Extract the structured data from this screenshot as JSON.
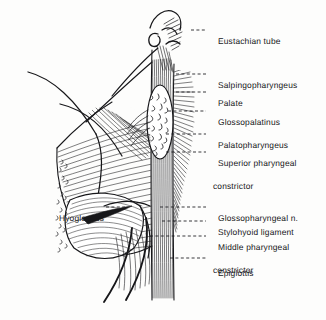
{
  "figure": {
    "kind": "anatomical-illustration",
    "background_color": "#fdfdfc",
    "ink_color": "#17171a",
    "width": 326,
    "height": 320
  },
  "labels": {
    "right": [
      {
        "id": "eustachian-tube",
        "text": "Eustachian tube",
        "continuation": "",
        "text_x": 208,
        "text_y": 26,
        "leader_from_x": 191,
        "leader_from_y": 30,
        "leader_to_x": 206,
        "leader_to_y": 30
      },
      {
        "id": "salpingopharyngeus",
        "text": "Salpingopharyngeus",
        "continuation": "",
        "text_x": 208,
        "text_y": 70,
        "leader_from_x": 176,
        "leader_from_y": 74,
        "leader_to_x": 206,
        "leader_to_y": 74
      },
      {
        "id": "palate",
        "text": "Palate",
        "continuation": "",
        "text_x": 208,
        "text_y": 88,
        "leader_from_x": 176,
        "leader_from_y": 92,
        "leader_to_x": 206,
        "leader_to_y": 92
      },
      {
        "id": "glossopalatinus",
        "text": "Glossopalatinus",
        "continuation": "",
        "text_x": 208,
        "text_y": 107,
        "leader_from_x": 168,
        "leader_from_y": 111,
        "leader_to_x": 206,
        "leader_to_y": 111
      },
      {
        "id": "palatopharyngeus",
        "text": "Palatopharyngeus",
        "continuation": "",
        "text_x": 208,
        "text_y": 130,
        "leader_from_x": 166,
        "leader_from_y": 134,
        "leader_to_x": 206,
        "leader_to_y": 134
      },
      {
        "id": "superior-pharyngeal-constrictor",
        "text": "Superior pharyngeal",
        "continuation": "constrictor",
        "text_x": 208,
        "text_y": 148,
        "leader_from_x": 166,
        "leader_from_y": 152,
        "leader_to_x": 206,
        "leader_to_y": 152
      },
      {
        "id": "glossopharyngeal-n",
        "text": "Glossopharyngeal n.",
        "continuation": "",
        "text_x": 208,
        "text_y": 203,
        "leader_from_x": 160,
        "leader_from_y": 207,
        "leader_to_x": 206,
        "leader_to_y": 207
      },
      {
        "id": "stylohyoid-ligament",
        "text": "Stylohyoid ligament",
        "continuation": "",
        "text_x": 208,
        "text_y": 217,
        "leader_from_x": 162,
        "leader_from_y": 221,
        "leader_to_x": 206,
        "leader_to_y": 221
      },
      {
        "id": "middle-pharyngeal-constrictor",
        "text": "Middle pharyngeal",
        "continuation": "constrictor",
        "text_x": 208,
        "text_y": 232,
        "leader_from_x": 150,
        "leader_from_y": 236,
        "leader_to_x": 206,
        "leader_to_y": 236
      },
      {
        "id": "epiglottis",
        "text": "Epiglottis",
        "continuation": "",
        "text_x": 208,
        "text_y": 258,
        "leader_from_x": 170,
        "leader_from_y": 258,
        "leader_to_x": 206,
        "leader_to_y": 258
      }
    ],
    "left": [
      {
        "id": "hyoglossus",
        "text": "Hyoglossus",
        "text_right_x": 104,
        "text_y": 203,
        "leader_from_x": 106,
        "leader_from_y": 207,
        "leader_to_x": 127,
        "leader_to_y": 207
      }
    ]
  },
  "structures": [
    {
      "id": "eustachian-tube-hook",
      "name": "Eustachian tube cartilage hook"
    },
    {
      "id": "palate-oval",
      "name": "Palate (stippled oval)"
    },
    {
      "id": "superior-constrictor-fan",
      "name": "Superior pharyngeal constrictor fan"
    },
    {
      "id": "vertical-muscle-band",
      "name": "Palatopharyngeus vertical band"
    },
    {
      "id": "hyoglossus-body",
      "name": "Hyoglossus muscle body"
    },
    {
      "id": "epiglottis-curves",
      "name": "Epiglottis and stylohyoid curves"
    }
  ]
}
